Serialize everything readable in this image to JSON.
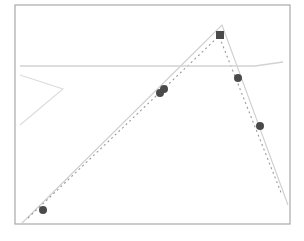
{
  "chart_data": {
    "type": "line",
    "title": "",
    "xlabel": "",
    "ylabel": "",
    "legend": [],
    "grid": false,
    "plot_area_px": {
      "x0": 15,
      "y0": 5,
      "x1": 290,
      "y1": 224
    },
    "series": [
      {
        "name": "solid-peak-line",
        "style": "solid",
        "color": "#cfcfcf",
        "points_px": [
          [
            20,
            225
          ],
          [
            222,
            25
          ],
          [
            288,
            205
          ]
        ]
      },
      {
        "name": "dotted-peak-line",
        "style": "dotted",
        "color": "#9a9a9a",
        "points_px": [
          [
            28,
            218
          ],
          [
            219,
            36
          ],
          [
            282,
            195
          ]
        ]
      },
      {
        "name": "horizontal-line",
        "style": "solid",
        "color": "#d2d2d2",
        "points_px": [
          [
            20,
            66
          ],
          [
            255,
            66
          ],
          [
            283,
            62
          ]
        ]
      },
      {
        "name": "angle-line",
        "style": "solid",
        "color": "#dcdcdc",
        "points_px": [
          [
            20,
            75
          ],
          [
            63,
            89
          ],
          [
            20,
            125
          ]
        ]
      }
    ],
    "markers": [
      {
        "shape": "circle",
        "x": 43,
        "y": 210,
        "color": "#4a4a4a"
      },
      {
        "shape": "circle",
        "x": 160,
        "y": 93,
        "color": "#4a4a4a"
      },
      {
        "shape": "circle",
        "x": 164,
        "y": 89,
        "color": "#4a4a4a"
      },
      {
        "shape": "square",
        "x": 220,
        "y": 35,
        "color": "#4a4a4a"
      },
      {
        "shape": "circle",
        "x": 238,
        "y": 78,
        "color": "#4a4a4a"
      },
      {
        "shape": "circle",
        "x": 260,
        "y": 126,
        "color": "#4a4a4a"
      }
    ]
  }
}
